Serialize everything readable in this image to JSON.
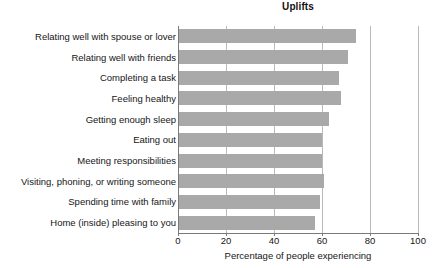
{
  "chart_data": {
    "type": "bar",
    "orientation": "horizontal",
    "title": "Uplifts",
    "xlabel": "Percentage of people experiencing",
    "ylabel": "",
    "xlim": [
      0,
      100
    ],
    "xticks": [
      0,
      20,
      40,
      60,
      80,
      100
    ],
    "xtick_labels": [
      "0",
      "20",
      "40",
      "60",
      "80",
      "100"
    ],
    "grid": "vertical",
    "legend": "none",
    "bar_color": "#a9a9a9",
    "categories": [
      "Relating well with spouse or lover",
      "Relating well with friends",
      "Completing a task",
      "Feeling healthy",
      "Getting enough sleep",
      "Eating out",
      "Meeting responsibilities",
      "Visiting, phoning, or writing someone",
      "Spending time with family",
      "Home (inside) pleasing to you"
    ],
    "values": [
      74,
      71,
      67,
      68,
      63,
      60,
      60,
      61,
      59,
      57
    ]
  }
}
